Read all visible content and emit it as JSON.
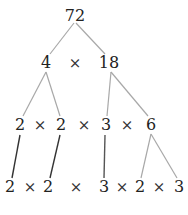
{
  "diagram": {
    "colors": {
      "text": "#222222",
      "line_light": "#a8a8a8",
      "line_dark": "#333333"
    },
    "level1": {
      "root": "72"
    },
    "level2": {
      "left": "4",
      "op": "×",
      "right": "18"
    },
    "level3": {
      "items": [
        "2",
        "×",
        "2",
        "×",
        "3",
        "×",
        "6"
      ]
    },
    "level4": {
      "items": [
        "2",
        "×",
        "2",
        "×",
        "3",
        "×",
        "2",
        "×",
        "3"
      ]
    }
  }
}
